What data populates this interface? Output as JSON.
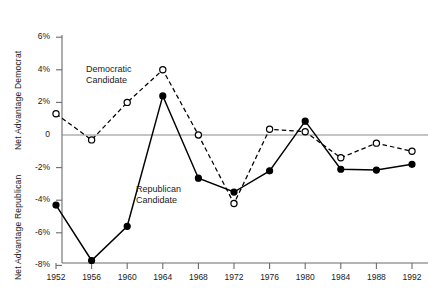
{
  "chart_data": {
    "type": "line",
    "title": "",
    "xlabel": "",
    "ylabel_top": "Net Advantage Democrat",
    "ylabel_bottom": "Net Advantage Republican",
    "categories": [
      1952,
      1956,
      1960,
      1964,
      1968,
      1972,
      1976,
      1980,
      1984,
      1988,
      1992
    ],
    "xtick_labels": [
      "1952",
      "1956",
      "1960",
      "1964",
      "1968",
      "1972",
      "1976",
      "1980",
      "1984",
      "1988",
      "1992"
    ],
    "ytick_labels": [
      "6%",
      "4%",
      "2%",
      "0",
      "-2%",
      "-4%",
      "-6%",
      "-8%"
    ],
    "ytick_values": [
      6,
      4,
      2,
      0,
      -2,
      -4,
      -6,
      -8
    ],
    "ylim": [
      -8,
      6
    ],
    "grid": false,
    "legend_position": "inline-annotation",
    "annotations": [
      {
        "text": "Democratic\nCandidate",
        "line1": "Democratic",
        "line2": "Candidate",
        "series": "democratic-candidate"
      },
      {
        "text": "Republican\nCandidate",
        "line1": "Republican",
        "line2": "Candidate",
        "series": "republican-candidate"
      }
    ],
    "series": [
      {
        "name": "Democratic Candidate",
        "marker": "open-circle",
        "line_style": "dashed",
        "color": "#000000",
        "values": [
          1.3,
          -0.3,
          2.0,
          4.0,
          0.0,
          -4.2,
          0.35,
          0.2,
          -1.4,
          -0.5,
          -1.0
        ]
      },
      {
        "name": "Republican Candidate",
        "marker": "filled-circle",
        "line_style": "solid",
        "color": "#000000",
        "values": [
          -4.3,
          -7.7,
          -5.6,
          2.4,
          -2.65,
          -3.5,
          -2.2,
          0.85,
          -2.1,
          -2.15,
          -1.8
        ]
      }
    ]
  }
}
